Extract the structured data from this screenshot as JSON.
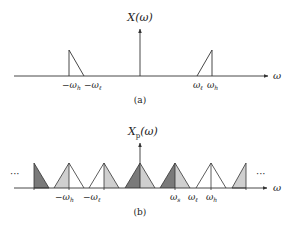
{
  "figure": {
    "panel_a": {
      "ylabel": "X(ω)",
      "xlabel": "ω",
      "caption": "(a)",
      "tick_labels": [
        {
          "id": "neg_wh",
          "text": "−ω",
          "sub": "h"
        },
        {
          "id": "neg_wl",
          "text": "−ω",
          "sub": "ℓ"
        },
        {
          "id": "wl",
          "text": "ω",
          "sub": "ℓ"
        },
        {
          "id": "wh",
          "text": "ω",
          "sub": "h"
        }
      ]
    },
    "panel_b": {
      "ylabel": "X",
      "ylabel_sub": "p",
      "ylabel_tail": "(ω)",
      "xlabel": "ω",
      "caption": "(b)",
      "ellipsis_left": "···",
      "ellipsis_right": "···",
      "tick_labels": [
        {
          "id": "neg_wh",
          "text": "−ω",
          "sub": "h"
        },
        {
          "id": "neg_wl",
          "text": "−ω",
          "sub": "ℓ"
        },
        {
          "id": "ws",
          "text": "ω",
          "sub": "s"
        },
        {
          "id": "wl",
          "text": "ω",
          "sub": "ℓ"
        },
        {
          "id": "wh",
          "text": "ω",
          "sub": "h"
        }
      ]
    },
    "colors": {
      "line": "#333333",
      "dark_fill": "#7a7a7a",
      "light_fill": "#cfcfcf",
      "white_fill": "#ffffff"
    }
  }
}
